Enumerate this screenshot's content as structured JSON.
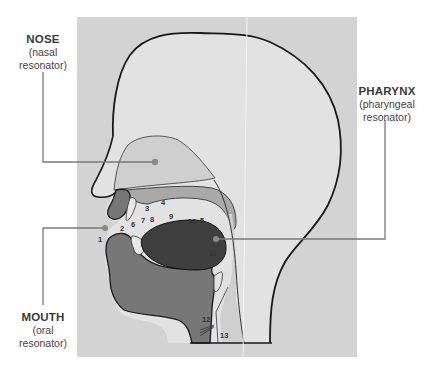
{
  "diagram": {
    "colors": {
      "panel": "#d3d3d3",
      "head": "#e2e2e2",
      "outline": "#1a1a1a",
      "cavity_light": "#cfcfcf",
      "palate": "#a9a9a9",
      "tissue": "#777777",
      "tongue": "#3f3f3f",
      "leader": "#7a7a7a"
    },
    "labels": {
      "nose": {
        "title": "NOSE",
        "line1": "(nasal",
        "line2": "resonator)"
      },
      "mouth": {
        "title": "MOUTH",
        "line1": "(oral",
        "line2": "resonator)"
      },
      "pharynx": {
        "title": "PHARYNX",
        "line1": "(pharyngeal",
        "line2": "resonator)"
      }
    },
    "numbers": [
      "1",
      "2",
      "3",
      "4",
      "5",
      "6",
      "7",
      "8",
      "9",
      "10",
      "11",
      "12",
      "13"
    ]
  }
}
